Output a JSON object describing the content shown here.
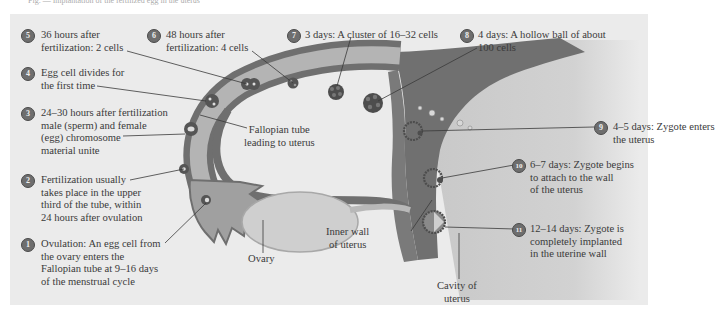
{
  "caption": "Fig. — Implantation of the fertilized egg in the uterus",
  "colors": {
    "panel_bg": "#ebebeb",
    "tube_wall": "#6f6f6f",
    "tube_lumen": "#b4b4b4",
    "ovary": "#cfcfcf",
    "uterus_wall": "#707070",
    "cavity": "#c8c8c8",
    "marker": "#6e6e6e"
  },
  "stages": [
    {
      "number": "1",
      "lines": [
        "Ovulation:  An egg cell from",
        "the ovary enters the",
        "Fallopian tube at 9–16 days",
        "of the menstrual cycle"
      ]
    },
    {
      "number": "2",
      "lines": [
        "Fertilization usually",
        "takes place in the upper",
        "third of the tube, within",
        "24 hours after ovulation"
      ]
    },
    {
      "number": "3",
      "lines": [
        "24–30 hours after fertilization",
        "male (sperm) and female",
        "(egg) chromosome",
        "material unite"
      ]
    },
    {
      "number": "4",
      "lines": [
        "Egg cell divides for",
        "the first time"
      ]
    },
    {
      "number": "5",
      "lines": [
        "36 hours after",
        "fertilization:  2 cells"
      ]
    },
    {
      "number": "6",
      "lines": [
        "48 hours after",
        "fertilization:  4 cells"
      ]
    },
    {
      "number": "7",
      "lines": [
        "3 days:  A cluster of 16–32 cells"
      ]
    },
    {
      "number": "8",
      "lines": [
        "4 days:  A hollow ball of about",
        "100 cells"
      ]
    },
    {
      "number": "9",
      "lines": [
        "4–5 days:  Zygote enters",
        "the uterus"
      ]
    },
    {
      "number": "10",
      "lines": [
        "6–7 days:  Zygote begins",
        "to attach to the wall",
        "of the uterus"
      ]
    },
    {
      "number": "11",
      "lines": [
        "12–14 days:  Zygote is",
        "completely implanted",
        "in the uterine wall"
      ]
    }
  ],
  "structures": {
    "fallopian_tube": [
      "Fallopian tube",
      "leading to uterus"
    ],
    "ovary": "Ovary",
    "inner_wall": [
      "Inner wall",
      "of uterus"
    ],
    "cavity": [
      "Cavity of",
      "uterus"
    ]
  }
}
